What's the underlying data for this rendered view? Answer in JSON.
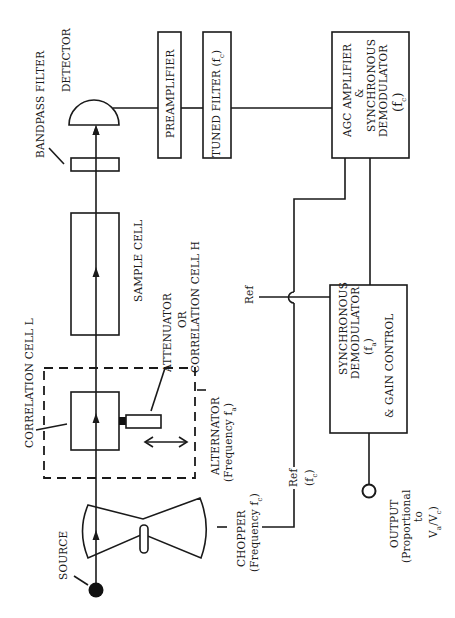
{
  "diagram": {
    "type": "block-diagram",
    "orientation": "rotated-90-ccw",
    "components": {
      "source": {
        "label": "SOURCE"
      },
      "chopper": {
        "label": "CHOPPER",
        "freq_prefix": "(Frequency f",
        "freq_sub": "c",
        "freq_suffix": ")"
      },
      "alternator": {
        "label": "ALTERNATOR",
        "freq_prefix": "(Frequency f",
        "freq_sub": "a",
        "freq_suffix": ")"
      },
      "correlation_cell_l": {
        "label": "CORRELATION CELL  L"
      },
      "attenuator": {
        "line1": "ATTENUATOR",
        "line2": "OR",
        "line3": "CORRELATION CELL H"
      },
      "sample_cell": {
        "label": "SAMPLE CELL"
      },
      "bandpass_filter": {
        "label": "BANDPASS FILTER"
      },
      "detector": {
        "label": "DETECTOR"
      },
      "preamplifier": {
        "label": "PREAMPLIFIER"
      },
      "tuned_filter": {
        "label_prefix": "TUNED FILTER (f",
        "label_sub": "c",
        "label_suffix": ")"
      },
      "agc_amplifier": {
        "line1": "AGC  AMPLIFIER",
        "line2": "&",
        "line3": "SYNCHRONOUS",
        "line4": "DEMODULATOR",
        "line5_prefix": "(f",
        "line5_sub": "c",
        "line5_suffix": ")"
      },
      "sync_demod": {
        "line1": "SYNCHRONOUS",
        "line2": "DEMODULATOR",
        "line3_prefix": "(f",
        "line3_sub": "a",
        "line3_suffix": ")",
        "line4": "& GAIN CONTROL"
      },
      "ref_a": {
        "label": "Ref"
      },
      "ref_c": {
        "label": "Ref",
        "freq_prefix": "(f",
        "freq_sub": "c",
        "freq_suffix": ")"
      },
      "output": {
        "line1": "OUTPUT",
        "line2": "(Proportional",
        "line3": "to",
        "line4_a": "V",
        "line4_a_sub": "a",
        "line4_slash": "/V",
        "line4_c_sub": "c",
        "line4_close": ")"
      }
    }
  }
}
